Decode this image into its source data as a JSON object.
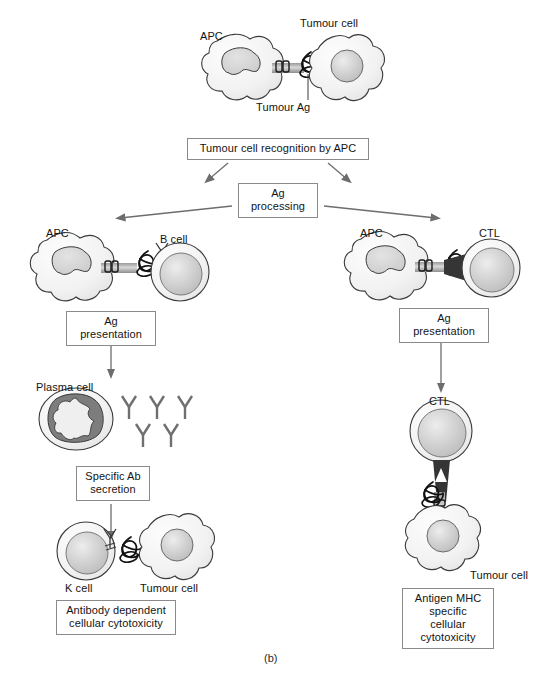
{
  "figure": {
    "caption": "(b)",
    "title_implicit": "Tumour cell recognition and antigen presentation pathways"
  },
  "colors": {
    "outline": "#3a3a3a",
    "box_border": "#8a8a8a",
    "arrow": "#6d6d6d",
    "cell_fill_light": "#f5f5f5",
    "nucleus_fill": "#cfcfcf",
    "plasma_dark": "#7d7d7d",
    "bridge_dark": "#3c3c3c",
    "text": "#141414"
  },
  "boxes": [
    {
      "id": "recognition",
      "text": "Tumour cell recognition by APC",
      "x": 187,
      "y": 138,
      "w": 182,
      "h": 21
    },
    {
      "id": "ag-processing",
      "text": "Ag processing",
      "x": 238,
      "y": 183,
      "w": 80,
      "h": 20
    },
    {
      "id": "ag-presentation-left",
      "text": "Ag presentation",
      "x": 66,
      "y": 311,
      "w": 90,
      "h": 20
    },
    {
      "id": "ag-presentation-right",
      "text": "Ag presentation",
      "x": 399,
      "y": 308,
      "w": 90,
      "h": 20
    },
    {
      "id": "specific-ab",
      "text": "Specific Ab\nsecretion",
      "x": 76,
      "y": 466,
      "w": 74,
      "h": 33
    },
    {
      "id": "adcc",
      "text": "Antibody dependent\ncellular cytotoxicity",
      "x": 56,
      "y": 600,
      "w": 120,
      "h": 33
    },
    {
      "id": "antigen-mhc",
      "text": "Antigen MHC\nspecific cellular\ncytotoxicity",
      "x": 402,
      "y": 588,
      "w": 92,
      "h": 46
    }
  ],
  "labels": [
    {
      "id": "apc-top",
      "text": "APC",
      "x": 200,
      "y": 30
    },
    {
      "id": "tumour-cell-top",
      "text": "Tumour cell",
      "x": 300,
      "y": 18
    },
    {
      "id": "tumour-ag",
      "text": "Tumour Ag",
      "x": 256,
      "y": 103
    },
    {
      "id": "apc-left",
      "text": "APC",
      "x": 46,
      "y": 228
    },
    {
      "id": "b-cell",
      "text": "B cell",
      "x": 160,
      "y": 234
    },
    {
      "id": "apc-right",
      "text": "APC",
      "x": 360,
      "y": 228
    },
    {
      "id": "ctl-top-right",
      "text": "CTL",
      "x": 478,
      "y": 228
    },
    {
      "id": "plasma-cell",
      "text": "Plasma cell",
      "x": 36,
      "y": 382
    },
    {
      "id": "ctl-mid-right",
      "text": "CTL",
      "x": 430,
      "y": 396
    },
    {
      "id": "k-cell",
      "text": "K cell",
      "x": 65,
      "y": 583
    },
    {
      "id": "tumour-cell-bot-left",
      "text": "Tumour cell",
      "x": 140,
      "y": 583
    },
    {
      "id": "tumour-cell-bot-right",
      "text": "Tumour cell",
      "x": 472,
      "y": 570
    }
  ],
  "cells": {
    "apc_top": {
      "cx": 243,
      "cy": 70,
      "type": "apc"
    },
    "tumour_top": {
      "cx": 333,
      "cy": 67,
      "type": "tumour"
    },
    "apc_left": {
      "cx": 73,
      "cy": 268,
      "type": "apc"
    },
    "b_cell": {
      "cx": 178,
      "cy": 272,
      "type": "round"
    },
    "apc_right": {
      "cx": 387,
      "cy": 267,
      "type": "apc"
    },
    "ctl_top_right": {
      "cx": 489,
      "cy": 268,
      "type": "round"
    },
    "plasma_cell": {
      "cx": 76,
      "cy": 418,
      "type": "plasma"
    },
    "ctl_mid_right": {
      "cx": 440,
      "cy": 431,
      "type": "round"
    },
    "tumour_bot_right": {
      "cx": 440,
      "cy": 540,
      "type": "tumour"
    },
    "k_cell": {
      "cx": 86,
      "cy": 551,
      "type": "round"
    },
    "tumour_bot_left": {
      "cx": 166,
      "cy": 545,
      "type": "tumour"
    }
  },
  "antibodies": {
    "count": 5,
    "row1": [
      128,
      156,
      184
    ],
    "row2": [
      142,
      170
    ],
    "row1_y": 404,
    "row2_y": 432
  },
  "icon_names": [
    "apc-cell-icon",
    "tumour-cell-icon",
    "b-cell-icon",
    "ctl-cell-icon",
    "k-cell-icon",
    "plasma-cell-icon",
    "antibody-icon",
    "tumour-antigen-icon",
    "mhc-bridge-icon",
    "arrow-icon"
  ]
}
